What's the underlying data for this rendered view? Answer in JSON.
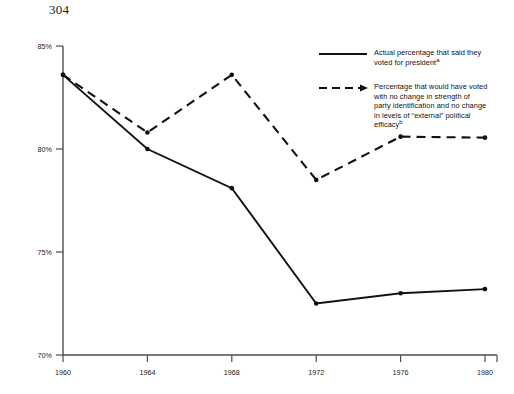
{
  "page_number": "304",
  "chart_data": {
    "type": "line",
    "title": "",
    "subtitle": "",
    "xlabel": "",
    "ylabel": "",
    "x": [
      1960,
      1964,
      1968,
      1972,
      1976,
      1980
    ],
    "categories": [
      "1960",
      "1964",
      "1968",
      "1972",
      "1976",
      "1980"
    ],
    "xtick_labels": [
      "1960",
      "1964",
      "1968",
      "1972",
      "1976",
      "1980"
    ],
    "ytick_labels": [
      "85%",
      "80%",
      "75%",
      "70%"
    ],
    "ytick_values": [
      85,
      80,
      75,
      70
    ],
    "ylim": [
      70,
      85
    ],
    "xlim": [
      1960,
      1980
    ],
    "grid": false,
    "legend_position": "upper-right",
    "series": [
      {
        "name": "Actual percentage that said they voted for president",
        "style": "solid",
        "marker": "dot",
        "color": "#111111",
        "values": [
          83.6,
          80.0,
          78.1,
          72.5,
          73.0,
          73.2
        ]
      },
      {
        "name": "Percentage that would have voted with no change in strength of party identification and no change in levels of \"external\" political efficacy",
        "style": "dashed",
        "marker": "dot",
        "color": "#111111",
        "values": [
          83.6,
          80.8,
          83.6,
          78.5,
          80.6,
          80.55
        ]
      }
    ]
  },
  "axis": {
    "y_ticks": [
      {
        "label": "85%",
        "value": 85
      },
      {
        "label": "80%",
        "value": 80
      },
      {
        "label": "75%",
        "value": 75
      },
      {
        "label": "70%",
        "value": 70
      }
    ],
    "x_ticks": [
      {
        "label": "1960",
        "value": 1960
      },
      {
        "label": "1964",
        "value": 1964
      },
      {
        "label": "1968",
        "value": 1968
      },
      {
        "label": "1972",
        "value": 1972
      },
      {
        "label": "1976",
        "value": 1976
      },
      {
        "label": "1980",
        "value": 1980
      }
    ]
  },
  "legend": {
    "entries": [
      {
        "style": "solid",
        "line1": "Actual percentage that said they",
        "line2": "voted for president",
        "footnote": "a"
      },
      {
        "style": "dashed",
        "line1": "Percentage that would have voted",
        "line2": "with no change in strength of",
        "line3": "party identification and no change",
        "line4": "in levels of “external” political",
        "line5": "efficacy",
        "footnote": "b"
      }
    ]
  },
  "colors": {
    "line": "#111111",
    "axis": "#555555",
    "text": "#111111",
    "background": "#ffffff"
  }
}
